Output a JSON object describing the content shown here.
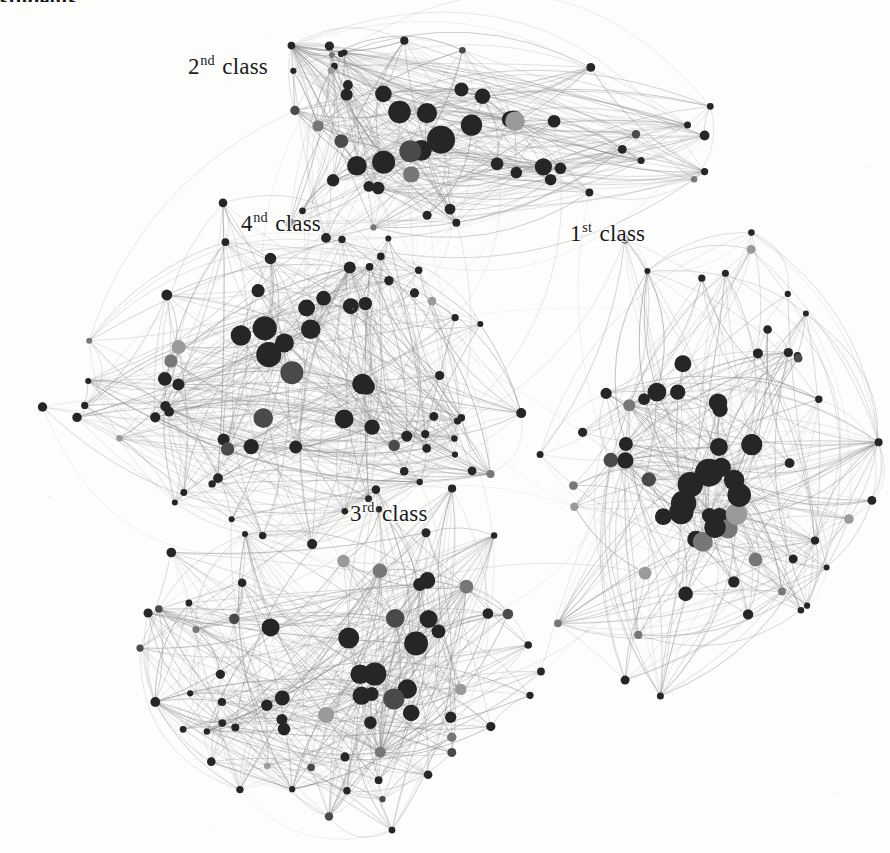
{
  "figure": {
    "title_fragment": "students.",
    "background_color": "#fdfdfc",
    "width": 890,
    "height": 853,
    "node_color_dark": "#262626",
    "node_color_mid": "#4a4a4a",
    "node_color_gray": "#777777",
    "node_color_light": "#9a9a9a",
    "edge_color": "#8c8c8c"
  },
  "labels": {
    "class1": {
      "number": "1",
      "ordinal": "st",
      "word": "class",
      "full": "1st class"
    },
    "class2": {
      "number": "2",
      "ordinal": "nd",
      "word": "class",
      "full": "2nd class"
    },
    "class3": {
      "number": "3",
      "ordinal": "rd",
      "word": "class",
      "full": "3rd class"
    },
    "class4": {
      "number": "4",
      "ordinal": "nd",
      "word": "class",
      "full": "4nd class"
    }
  },
  "chart_data": {
    "type": "scatter",
    "title": "students.",
    "xlabel": "",
    "ylabel": "",
    "grid": false,
    "legend": "none",
    "xlim": [
      0,
      890
    ],
    "ylim": [
      0,
      853
    ],
    "clusters": [
      {
        "name": "2nd class",
        "label_x": 188,
        "label_y": 55,
        "center": [
          440,
          140
        ],
        "radius_x": 235,
        "radius_y": 95,
        "node_count": 56
      },
      {
        "name": "4nd class",
        "label_x": 241,
        "label_y": 212,
        "center": [
          290,
          370
        ],
        "radius_x": 205,
        "radius_y": 155,
        "node_count": 72
      },
      {
        "name": "1st class",
        "label_x": 570,
        "label_y": 222,
        "center": [
          700,
          470
        ],
        "radius_x": 150,
        "radius_y": 215,
        "node_count": 66
      },
      {
        "name": "3rd class",
        "label_x": 350,
        "label_y": 502,
        "center": [
          370,
          650
        ],
        "radius_x": 200,
        "radius_y": 155,
        "node_count": 70
      }
    ],
    "node_size_range": [
      3,
      14
    ],
    "series": [
      {
        "name": "2nd class nodes",
        "values": 56
      },
      {
        "name": "4nd class nodes",
        "values": 72
      },
      {
        "name": "1st class nodes",
        "values": 66
      },
      {
        "name": "3rd class nodes",
        "values": 70
      }
    ]
  }
}
